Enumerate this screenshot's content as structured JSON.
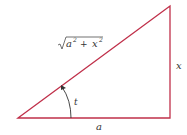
{
  "diagram": {
    "type": "right-triangle",
    "line_color": "#c0304a",
    "arrow_color": "#333333",
    "vertices": {
      "left": [
        18,
        118
      ],
      "top_right": [
        170,
        6
      ],
      "bottom_right": [
        170,
        118
      ]
    },
    "labels": {
      "hypotenuse_prefix": "a",
      "hypotenuse_plus": "+",
      "hypotenuse_x": "x",
      "hypotenuse_exp": "2",
      "vertical_side": "x",
      "base_side": "a",
      "angle": "t"
    }
  }
}
